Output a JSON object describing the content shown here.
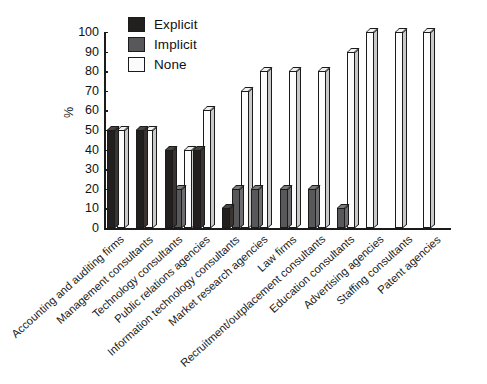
{
  "chart_data": {
    "type": "bar",
    "title": "",
    "xlabel": "",
    "ylabel": "%",
    "ylim": [
      0,
      100
    ],
    "yticks": [
      0,
      10,
      20,
      30,
      40,
      50,
      60,
      70,
      80,
      90,
      100
    ],
    "grid": false,
    "legend_position": "top-left",
    "categories": [
      "Accounting and auditing firms",
      "Management consultants",
      "Technology consultants",
      "Public relations agencies",
      "Information technology consultants",
      "Market research agencies",
      "Law firms",
      "Recruitment/outplacement consultants",
      "Education consultants",
      "Advertising agencies",
      "Staffing consultants",
      "Patent agencies"
    ],
    "series": [
      {
        "name": "Explicit",
        "color": "#231f1e",
        "values": [
          50,
          50,
          40,
          40,
          10,
          0,
          0,
          0,
          0,
          0,
          0,
          0
        ]
      },
      {
        "name": "Implicit",
        "color": "#58585a",
        "values": [
          0,
          0,
          20,
          0,
          20,
          20,
          20,
          20,
          10,
          0,
          0,
          0
        ]
      },
      {
        "name": "None",
        "color": "#fdfdfd",
        "values": [
          50,
          50,
          40,
          60,
          70,
          80,
          80,
          80,
          90,
          100,
          100,
          100
        ]
      }
    ]
  },
  "legend": {
    "items": [
      {
        "label": "Explicit"
      },
      {
        "label": "Implicit"
      },
      {
        "label": "None"
      }
    ]
  },
  "axis": {
    "y_label": "%"
  }
}
